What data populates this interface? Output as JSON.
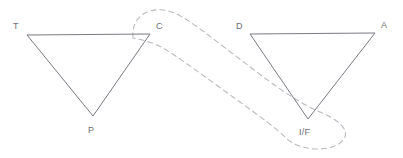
{
  "figure": {
    "background_color": "#ffffff",
    "stroke_color": "#7a7a82",
    "dashed_color": "#b9b9c0",
    "label_color": "#6e6e74",
    "triangles": [
      {
        "name": "left-triangle",
        "vertices": [
          {
            "label": "T",
            "x": 27,
            "y": 35,
            "label_x": 13,
            "label_y": 22
          },
          {
            "label": "C",
            "x": 150,
            "y": 34,
            "label_x": 156,
            "label_y": 22
          },
          {
            "label": "P",
            "x": 93,
            "y": 116,
            "label_x": 88,
            "label_y": 126
          }
        ]
      },
      {
        "name": "right-triangle",
        "vertices": [
          {
            "label": "D",
            "x": 250,
            "y": 34,
            "label_x": 236,
            "label_y": 22
          },
          {
            "label": "A",
            "x": 375,
            "y": 33,
            "label_x": 381,
            "label_y": 21
          },
          {
            "label": "I/F",
            "x": 308,
            "y": 119,
            "label_x": 299,
            "label_y": 128
          }
        ]
      }
    ],
    "connector": {
      "name": "dashed-correspondence-loop",
      "style": "dashed",
      "dash_pattern": "5 4",
      "from_vertex": "C",
      "to_vertex": "I/F"
    }
  }
}
